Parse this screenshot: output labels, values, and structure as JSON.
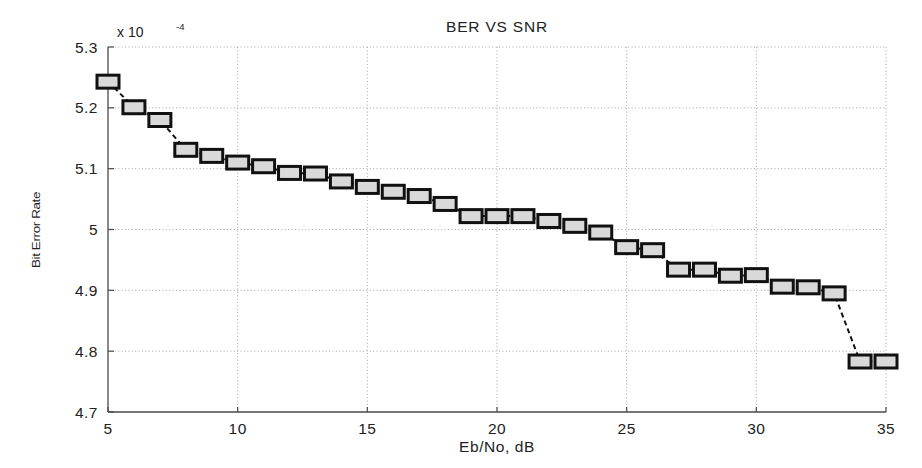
{
  "chart_data": {
    "type": "line",
    "title": "BER VS SNR",
    "xlabel": "Eb/No, dB",
    "ylabel": "Bit Error Rate",
    "y_exponent_label": "x 10",
    "y_exponent_value": "-4",
    "y_scale_factor": 0.0001,
    "xlim": [
      5,
      35
    ],
    "ylim": [
      4.7,
      5.3
    ],
    "xticks": [
      5,
      10,
      15,
      20,
      25,
      30,
      35
    ],
    "xticklabels": [
      "5",
      "10",
      "15",
      "20",
      "25",
      "30",
      "35"
    ],
    "yticks": [
      4.7,
      4.8,
      4.9,
      5.0,
      5.1,
      5.2,
      5.3
    ],
    "yticklabels": [
      "4.7",
      "4.8",
      "4.9",
      "5",
      "5.1",
      "5.2",
      "5.3"
    ],
    "grid": true,
    "grid_style": "dotted",
    "legend": null,
    "marker": "square",
    "marker_face_color": "#d9d9d9",
    "marker_edge_color": "#111111",
    "line_style": "dashed",
    "line_color": "#111111",
    "x": [
      5,
      6,
      7,
      8,
      9,
      10,
      11,
      12,
      13,
      14,
      15,
      16,
      17,
      18,
      19,
      20,
      21,
      22,
      23,
      24,
      25,
      26,
      27,
      28,
      29,
      30,
      31,
      32,
      33,
      34,
      35
    ],
    "values": [
      5.243,
      5.201,
      5.18,
      5.131,
      5.121,
      5.11,
      5.104,
      5.093,
      5.092,
      5.079,
      5.07,
      5.062,
      5.055,
      5.042,
      5.022,
      5.022,
      5.022,
      5.014,
      5.006,
      4.995,
      4.971,
      4.966,
      4.934,
      4.934,
      4.924,
      4.925,
      4.906,
      4.905,
      4.895,
      4.783,
      4.783
    ]
  },
  "axes": {
    "x_tick_label_5": "5",
    "x_tick_label_10": "10",
    "x_tick_label_15": "15",
    "x_tick_label_20": "20",
    "x_tick_label_25": "25",
    "x_tick_label_30": "30",
    "x_tick_label_35": "35",
    "y_tick_label_1": "5.3",
    "y_tick_label_2": "5.2",
    "y_tick_label_3": "5.1",
    "y_tick_label_4": "5",
    "y_tick_label_5": "4.9",
    "y_tick_label_6": "4.8",
    "y_tick_label_7": "4.7"
  }
}
